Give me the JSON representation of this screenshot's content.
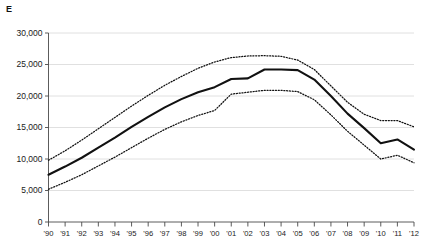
{
  "corner_label": "E",
  "chart_data": {
    "type": "line",
    "title": "E",
    "xlabel": "",
    "ylabel": "",
    "grid": true,
    "legend": "none",
    "ylim": [
      0,
      30000
    ],
    "yticks": [
      0,
      5000,
      10000,
      15000,
      20000,
      25000,
      30000
    ],
    "ytick_labels": [
      "0",
      "5,000",
      "10,000",
      "15,000",
      "20,000",
      "25,000",
      "30,000"
    ],
    "x": [
      "'90",
      "'91",
      "'92",
      "'93",
      "'94",
      "'95",
      "'96",
      "'97",
      "'98",
      "'99",
      "'00",
      "'01",
      "'02",
      "'03",
      "'04",
      "'05",
      "'06",
      "'07",
      "'08",
      "'09",
      "'10",
      "'11",
      "'12"
    ],
    "categories": [
      "'90",
      "'91",
      "'92",
      "'93",
      "'94",
      "'95",
      "'96",
      "'97",
      "'98",
      "'99",
      "'00",
      "'01",
      "'02",
      "'03",
      "'04",
      "'05",
      "'06",
      "'07",
      "'08",
      "'09",
      "'10",
      "'11",
      "'12"
    ],
    "series": [
      {
        "name": "upper bound",
        "style": "dotted",
        "color": "#111111",
        "values": [
          9800,
          11300,
          13000,
          14800,
          16600,
          18400,
          20100,
          21700,
          23100,
          24400,
          25400,
          26100,
          26350,
          26400,
          26300,
          25700,
          24200,
          21600,
          19000,
          17100,
          16100,
          16100,
          15100
        ]
      },
      {
        "name": "central estimate",
        "style": "solid",
        "color": "#111111",
        "values": [
          7500,
          8800,
          10200,
          11800,
          13400,
          15100,
          16700,
          18200,
          19500,
          20600,
          21400,
          22700,
          22800,
          24200,
          24200,
          24100,
          22600,
          20000,
          17200,
          14900,
          12500,
          13100,
          11500
        ]
      },
      {
        "name": "lower bound",
        "style": "dotted",
        "color": "#111111",
        "values": [
          5200,
          6300,
          7500,
          8900,
          10300,
          11800,
          13300,
          14700,
          15900,
          16900,
          17700,
          20300,
          20600,
          20900,
          20900,
          20700,
          19400,
          17000,
          14400,
          12200,
          10000,
          10600,
          9400
        ]
      }
    ]
  }
}
